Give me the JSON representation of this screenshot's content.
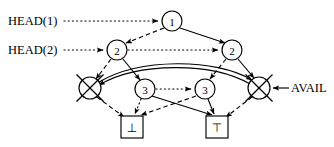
{
  "diagram": {
    "canvas": {
      "width": 334,
      "height": 147,
      "background": "#ffffff"
    },
    "ink_color": "#000000",
    "labels": {
      "head1": "HEAD(1)",
      "head2": "HEAD(2)",
      "avail": "AVAIL"
    },
    "nodes": [
      {
        "id": "n1",
        "label": "1",
        "shape": "circle",
        "cx": 172,
        "cy": 21,
        "r": 10
      },
      {
        "id": "n2l",
        "label": "2",
        "shape": "circle",
        "cx": 117,
        "cy": 50,
        "r": 10
      },
      {
        "id": "n2r",
        "label": "2",
        "shape": "circle",
        "cx": 232,
        "cy": 50,
        "r": 10
      },
      {
        "id": "n3l",
        "label": "3",
        "shape": "circle",
        "cx": 145,
        "cy": 89,
        "r": 10
      },
      {
        "id": "n3r",
        "label": "3",
        "shape": "circle",
        "cx": 205,
        "cy": 89,
        "r": 10
      },
      {
        "id": "xl",
        "label": "",
        "shape": "crossed-circle",
        "cx": 90,
        "cy": 88,
        "r": 11
      },
      {
        "id": "xr",
        "label": "",
        "shape": "crossed-circle",
        "cx": 259,
        "cy": 88,
        "r": 11
      },
      {
        "id": "bl",
        "label": "⊥",
        "shape": "box",
        "cx": 132,
        "cy": 127,
        "w": 22,
        "h": 22
      },
      {
        "id": "br",
        "label": "⊤",
        "shape": "box",
        "cx": 217,
        "cy": 127,
        "w": 22,
        "h": 22
      }
    ],
    "edges": [
      {
        "from": "head1-label",
        "to": "n1",
        "style": "dotted",
        "arrow": true
      },
      {
        "from": "head2-label",
        "to": "n2l",
        "style": "dotted",
        "arrow": true
      },
      {
        "from": "n2l",
        "to": "n2r",
        "style": "dotted",
        "arrow": true
      },
      {
        "from": "n3l",
        "to": "n3r",
        "style": "dotted",
        "arrow": true
      },
      {
        "from": "n1",
        "to": "n2l",
        "style": "dashed",
        "arrow": true
      },
      {
        "from": "n1",
        "to": "n2r",
        "style": "solid",
        "arrow": true
      },
      {
        "from": "n2l",
        "to": "xl",
        "style": "dashed",
        "arrow": true
      },
      {
        "from": "n2l",
        "to": "n3l",
        "style": "solid",
        "arrow": true
      },
      {
        "from": "n2r",
        "to": "n3r",
        "style": "dashed",
        "arrow": true
      },
      {
        "from": "n2r",
        "to": "xr",
        "style": "solid",
        "arrow": true
      },
      {
        "from": "xl",
        "to": "bl",
        "style": "dashed",
        "arrow": true
      },
      {
        "from": "n3l",
        "to": "bl",
        "style": "dotted",
        "arrow": true
      },
      {
        "from": "n3l",
        "to": "br",
        "style": "solid",
        "arrow": true
      },
      {
        "from": "n3r",
        "to": "bl",
        "style": "dashed",
        "arrow": true
      },
      {
        "from": "n3r",
        "to": "br",
        "style": "solid",
        "arrow": true
      },
      {
        "from": "xr",
        "to": "br",
        "style": "dashed",
        "arrow": true
      },
      {
        "from": "xl",
        "to": "xr",
        "style": "solid",
        "arrow": true,
        "curved": true
      },
      {
        "from": "xr",
        "to": "xl",
        "style": "solid",
        "arrow": true,
        "curved": true
      },
      {
        "from": "avail-label",
        "to": "xr",
        "style": "solid",
        "arrow": true
      }
    ]
  }
}
